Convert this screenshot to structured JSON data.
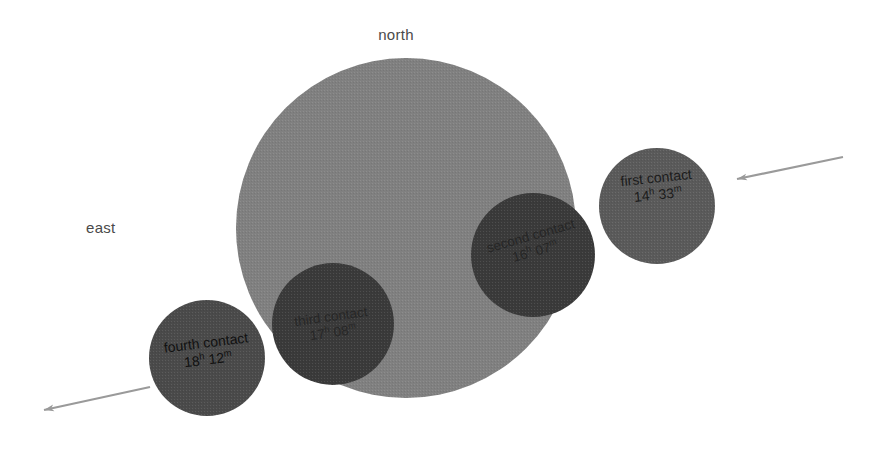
{
  "figure": {
    "background_color": "#ffffff",
    "cardinals": [
      {
        "id": "north",
        "label": "north"
      },
      {
        "id": "east",
        "label": "east"
      }
    ],
    "colors": {
      "background": "#ffffff",
      "large_disk": "#808080",
      "mid_disk": "#5a5a5a",
      "dark_disk": "#3a3a3a",
      "arrow": "#9a9a9a",
      "label_text": "#4a4a4a"
    },
    "large_disk": {
      "name": "occulted-body",
      "cx": 406,
      "cy": 228,
      "r": 170,
      "fill": "#808080"
    },
    "contacts": [
      {
        "id": "first",
        "name": "first contact",
        "time_hours": "14",
        "time_minutes": "33",
        "time_text": "14h 33m",
        "cx": 657,
        "cy": 206,
        "r": 58,
        "fill": "#5a5a5a"
      },
      {
        "id": "second",
        "name": "second contact",
        "time_hours": "16",
        "time_minutes": "07",
        "time_text": "16h 07m",
        "cx": 533,
        "cy": 255,
        "r": 62,
        "fill": "#3a3a3a"
      },
      {
        "id": "third",
        "name": "third contact",
        "time_hours": "17",
        "time_minutes": "08",
        "time_text": "17h 08m",
        "cx": 333,
        "cy": 324,
        "r": 61,
        "fill": "#3a3a3a"
      },
      {
        "id": "fourth",
        "name": "fourth contact",
        "time_hours": "18",
        "time_minutes": "12",
        "time_text": "18h 12m",
        "cx": 207,
        "cy": 358,
        "r": 58,
        "fill": "#4a4a4a"
      }
    ],
    "arrows": [
      {
        "id": "entry",
        "name": "motion-arrow-entry",
        "x1": 843,
        "y1": 157,
        "x2": 737,
        "y2": 179
      },
      {
        "id": "exit",
        "name": "motion-arrow-exit",
        "x1": 150,
        "y1": 387,
        "x2": 44,
        "y2": 410
      }
    ]
  }
}
